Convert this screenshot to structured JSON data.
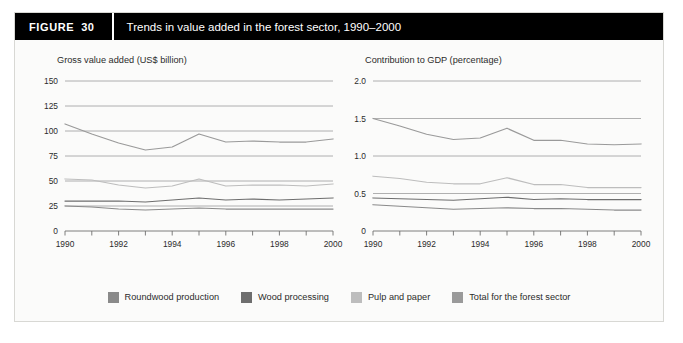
{
  "figure": {
    "label": "FIGURE",
    "number": "30",
    "title": "Trends in value added in the forest sector, 1990–2000",
    "title_bar_color": "#000000",
    "title_text_color": "#ffffff",
    "panel_background": "#fbfbfa",
    "border_color": "#d8d8d4"
  },
  "legend": {
    "position": "bottom-center",
    "items": [
      {
        "label": "Roundwood production",
        "color": "#8a8a8a",
        "icon": "legend-swatch-icon"
      },
      {
        "label": "Wood processing",
        "color": "#6e6e6e",
        "icon": "legend-swatch-icon"
      },
      {
        "label": "Pulp and paper",
        "color": "#bdbdbd",
        "icon": "legend-swatch-icon"
      },
      {
        "label": "Total for the forest sector",
        "color": "#9a9a9a",
        "icon": "legend-swatch-icon"
      }
    ]
  },
  "chart_data": [
    {
      "id": "gross-value-added",
      "type": "line",
      "title": "Gross value added (US$ billion)",
      "xlabel": "",
      "ylabel": "",
      "grid": true,
      "legend_position": "bottom",
      "x": [
        1990,
        1991,
        1992,
        1993,
        1994,
        1995,
        1996,
        1997,
        1998,
        1999,
        2000
      ],
      "xtick_labels": [
        "1990",
        "",
        "1992",
        "",
        "1994",
        "",
        "1996",
        "",
        "1998",
        "",
        "2000"
      ],
      "xlim": [
        1990,
        2000
      ],
      "ylim": [
        0,
        150
      ],
      "yticks": [
        0,
        25,
        50,
        75,
        100,
        125,
        150
      ],
      "ytick_labels": [
        "0",
        "25",
        "50",
        "75",
        "100",
        "125",
        "150"
      ],
      "series": [
        {
          "name": "Total for the forest sector",
          "color": "#9a9a9a",
          "values": [
            107,
            97,
            88,
            81,
            84,
            97,
            89,
            90,
            89,
            89,
            92
          ]
        },
        {
          "name": "Pulp and paper",
          "color": "#bdbdbd",
          "values": [
            52,
            51,
            46,
            43,
            45,
            52,
            45,
            46,
            46,
            45,
            47
          ]
        },
        {
          "name": "Wood processing",
          "color": "#6e6e6e",
          "values": [
            30,
            30,
            30,
            29,
            31,
            33,
            31,
            32,
            31,
            32,
            33
          ]
        },
        {
          "name": "Roundwood production",
          "color": "#8a8a8a",
          "values": [
            25,
            24,
            22,
            21,
            22,
            23,
            22,
            22,
            22,
            22,
            22
          ]
        }
      ]
    },
    {
      "id": "contribution-to-gdp",
      "type": "line",
      "title": "Contribution to GDP (percentage)",
      "xlabel": "",
      "ylabel": "",
      "grid": true,
      "legend_position": "bottom",
      "x": [
        1990,
        1991,
        1992,
        1993,
        1994,
        1995,
        1996,
        1997,
        1998,
        1999,
        2000
      ],
      "xtick_labels": [
        "1990",
        "",
        "1992",
        "",
        "1994",
        "",
        "1996",
        "",
        "1998",
        "",
        "2000"
      ],
      "xlim": [
        1990,
        2000
      ],
      "ylim": [
        0,
        2.0
      ],
      "yticks": [
        0,
        0.5,
        1.0,
        1.5,
        2.0
      ],
      "ytick_labels": [
        "0",
        "0.5",
        "1.0",
        "1.5",
        "2.0"
      ],
      "series": [
        {
          "name": "Total for the forest sector",
          "color": "#9a9a9a",
          "values": [
            1.5,
            1.4,
            1.29,
            1.22,
            1.24,
            1.37,
            1.21,
            1.21,
            1.16,
            1.15,
            1.16
          ]
        },
        {
          "name": "Pulp and paper",
          "color": "#bdbdbd",
          "values": [
            0.73,
            0.7,
            0.65,
            0.63,
            0.63,
            0.71,
            0.62,
            0.62,
            0.58,
            0.58,
            0.58
          ]
        },
        {
          "name": "Wood processing",
          "color": "#6e6e6e",
          "values": [
            0.44,
            0.43,
            0.42,
            0.41,
            0.43,
            0.45,
            0.42,
            0.43,
            0.42,
            0.42,
            0.42
          ]
        },
        {
          "name": "Roundwood production",
          "color": "#8a8a8a",
          "values": [
            0.35,
            0.33,
            0.31,
            0.29,
            0.3,
            0.31,
            0.3,
            0.3,
            0.29,
            0.28,
            0.28
          ]
        }
      ]
    }
  ]
}
